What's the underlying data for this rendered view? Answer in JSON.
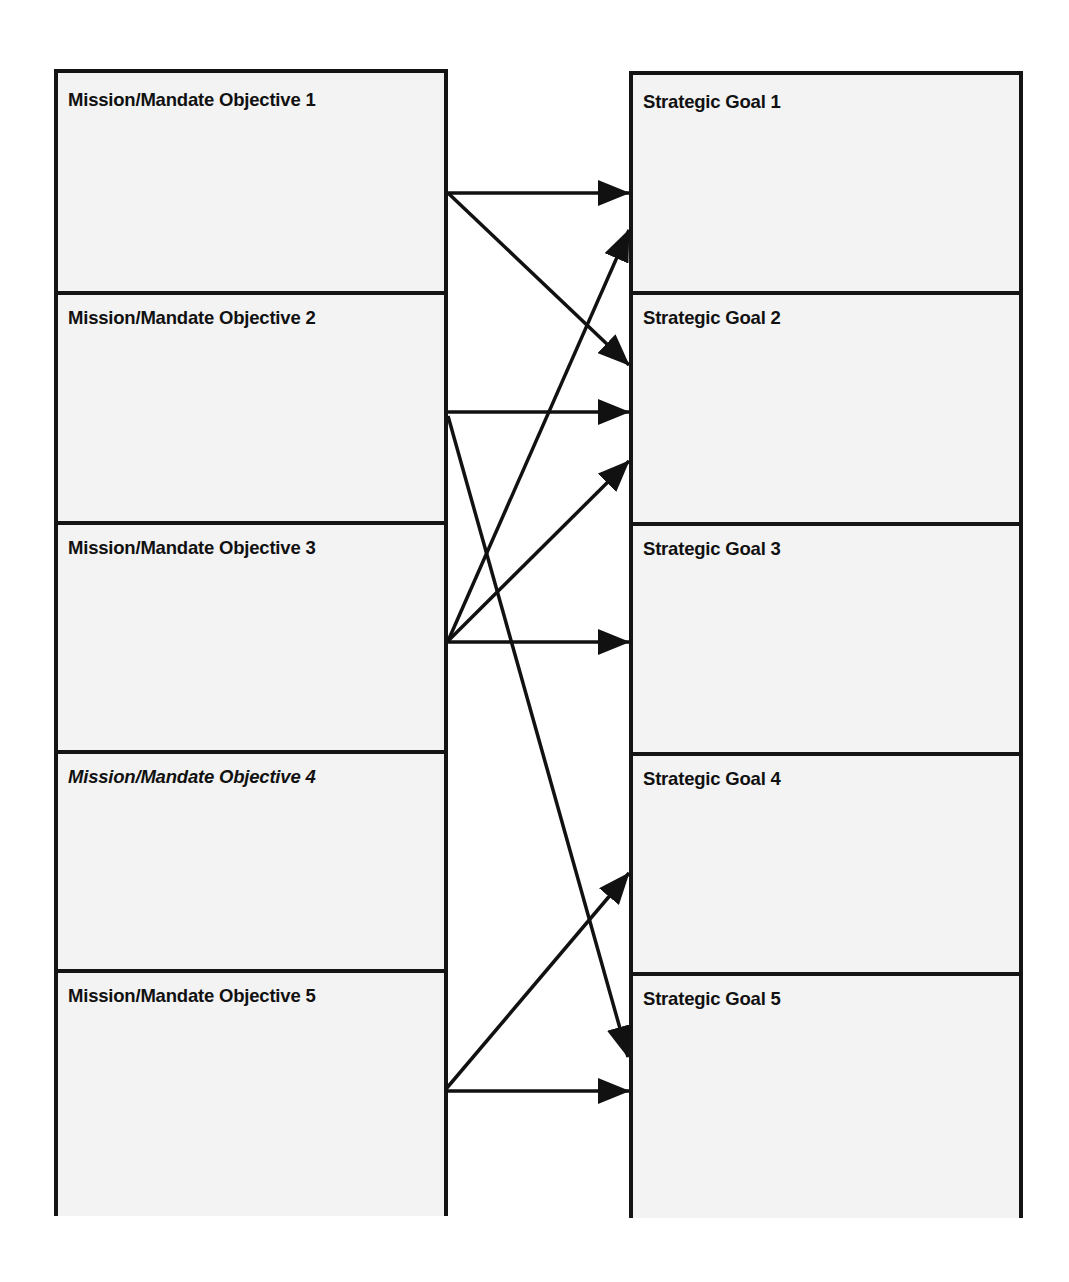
{
  "diagram": {
    "left_column": {
      "items": [
        {
          "label": "Mission/Mandate Objective 1",
          "italic": false
        },
        {
          "label": "Mission/Mandate Objective 2",
          "italic": false
        },
        {
          "label": "Mission/Mandate Objective 3",
          "italic": false
        },
        {
          "label": "Mission/Mandate Objective 4",
          "italic": true
        },
        {
          "label": "Mission/Mandate Objective 5",
          "italic": false
        }
      ]
    },
    "right_column": {
      "items": [
        {
          "label": "Strategic Goal 1"
        },
        {
          "label": "Strategic Goal 2"
        },
        {
          "label": "Strategic Goal 3"
        },
        {
          "label": "Strategic Goal 4"
        },
        {
          "label": "Strategic Goal 5"
        }
      ]
    },
    "connections": [
      {
        "from": "Mission/Mandate Objective 1",
        "to": "Strategic Goal 1"
      },
      {
        "from": "Mission/Mandate Objective 1",
        "to": "Strategic Goal 2"
      },
      {
        "from": "Mission/Mandate Objective 2",
        "to": "Strategic Goal 2"
      },
      {
        "from": "Mission/Mandate Objective 2",
        "to": "Strategic Goal 5"
      },
      {
        "from": "Mission/Mandate Objective 3",
        "to": "Strategic Goal 1"
      },
      {
        "from": "Mission/Mandate Objective 3",
        "to": "Strategic Goal 2"
      },
      {
        "from": "Mission/Mandate Objective 3",
        "to": "Strategic Goal 3"
      },
      {
        "from": "Mission/Mandate Objective 5",
        "to": "Strategic Goal 4"
      },
      {
        "from": "Mission/Mandate Objective 5",
        "to": "Strategic Goal 5"
      }
    ],
    "colors": {
      "border": "#141414",
      "fill": "#f3f3f3",
      "arrow": "#111111",
      "text": "#111111"
    }
  }
}
